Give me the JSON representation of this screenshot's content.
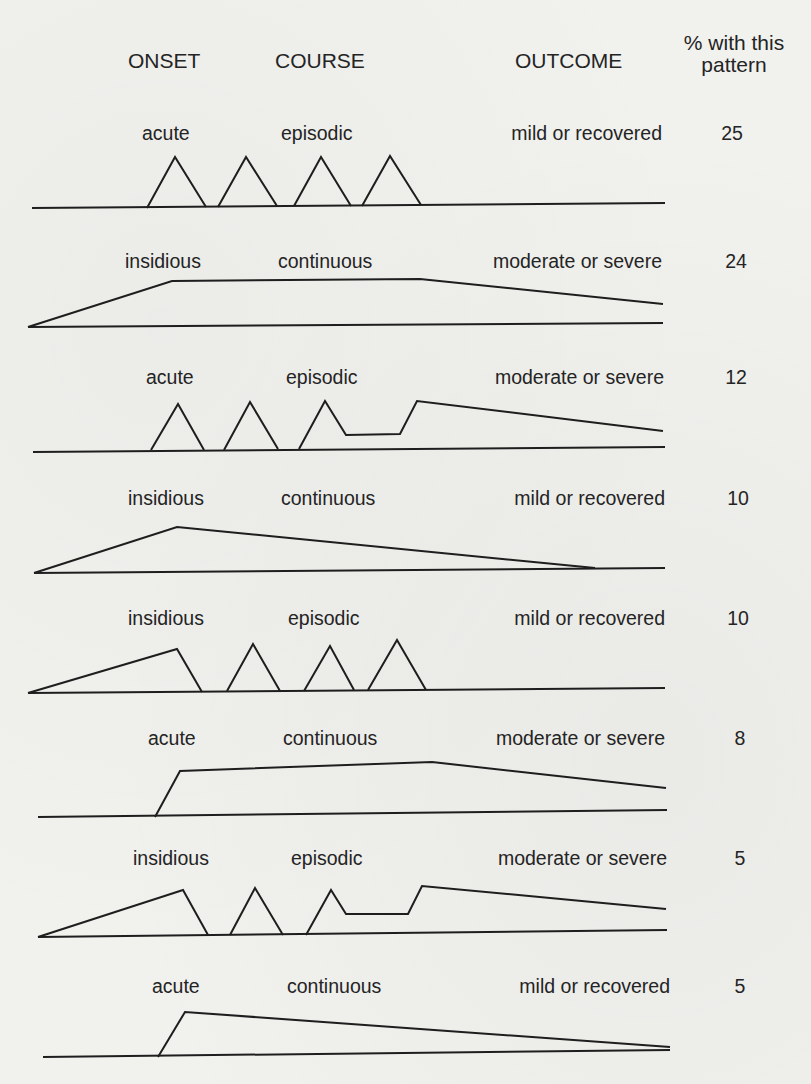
{
  "headers": {
    "onset": "ONSET",
    "course": "COURSE",
    "outcome": "OUTCOME",
    "percent_line1": "% with this",
    "percent_line2": "pattern"
  },
  "patterns": [
    {
      "onset": "acute",
      "course": "episodic",
      "outcome": "mild or recovered",
      "percent": "25",
      "label_y": 140,
      "onset_x": 142,
      "course_x": 281,
      "outcome_right": 662,
      "percent_x": 732,
      "baseline": [
        [
          32,
          208
        ],
        [
          665,
          203
        ]
      ],
      "curves": [
        [
          [
            147,
            208
          ],
          [
            175,
            157
          ],
          [
            206,
            207
          ]
        ],
        [
          [
            218,
            207
          ],
          [
            246,
            157
          ],
          [
            277,
            206
          ]
        ],
        [
          [
            294,
            206
          ],
          [
            321,
            157
          ],
          [
            351,
            206
          ]
        ],
        [
          [
            362,
            206
          ],
          [
            390,
            156
          ],
          [
            421,
            205
          ]
        ]
      ]
    },
    {
      "onset": "insidious",
      "course": "continuous",
      "outcome": "moderate or severe",
      "percent": "24",
      "label_y": 268,
      "onset_x": 125,
      "course_x": 278,
      "outcome_right": 662,
      "percent_x": 736,
      "baseline": [
        [
          28,
          327
        ],
        [
          663,
          323
        ]
      ],
      "curves": [
        [
          [
            28,
            327
          ],
          [
            172,
            281
          ],
          [
            420,
            279
          ],
          [
            663,
            304
          ]
        ]
      ]
    },
    {
      "onset": "acute",
      "course": "episodic",
      "outcome": "moderate or severe",
      "percent": "12",
      "label_y": 384,
      "onset_x": 146,
      "course_x": 286,
      "outcome_right": 664,
      "percent_x": 736,
      "baseline": [
        [
          33,
          452
        ],
        [
          665,
          447
        ]
      ],
      "curves": [
        [
          [
            151,
            450
          ],
          [
            178,
            404
          ],
          [
            204,
            450
          ]
        ],
        [
          [
            224,
            450
          ],
          [
            250,
            402
          ],
          [
            278,
            449
          ]
        ],
        [
          [
            299,
            449
          ],
          [
            325,
            401
          ],
          [
            346,
            435
          ],
          [
            400,
            434
          ],
          [
            417,
            401
          ],
          [
            663,
            431
          ]
        ]
      ]
    },
    {
      "onset": "insidious",
      "course": "continuous",
      "outcome": "mild or recovered",
      "percent": "10",
      "label_y": 505,
      "onset_x": 128,
      "course_x": 281,
      "outcome_right": 665,
      "percent_x": 738,
      "baseline": [
        [
          34,
          573
        ],
        [
          665,
          568
        ]
      ],
      "curves": [
        [
          [
            34,
            573
          ],
          [
            177,
            527
          ],
          [
            595,
            568
          ]
        ]
      ]
    },
    {
      "onset": "insidious",
      "course": "episodic",
      "outcome": "mild or recovered",
      "percent": "10",
      "label_y": 625,
      "onset_x": 128,
      "course_x": 288,
      "outcome_right": 665,
      "percent_x": 738,
      "baseline": [
        [
          28,
          693
        ],
        [
          665,
          688
        ]
      ],
      "curves": [
        [
          [
            28,
            693
          ],
          [
            177,
            649
          ],
          [
            202,
            692
          ]
        ],
        [
          [
            227,
            691
          ],
          [
            253,
            644
          ],
          [
            280,
            691
          ]
        ],
        [
          [
            304,
            691
          ],
          [
            330,
            646
          ],
          [
            354,
            690
          ]
        ],
        [
          [
            368,
            690
          ],
          [
            397,
            640
          ],
          [
            426,
            690
          ]
        ]
      ]
    },
    {
      "onset": "acute",
      "course": "continuous",
      "outcome": "moderate or severe",
      "percent": "8",
      "label_y": 745,
      "onset_x": 148,
      "course_x": 283,
      "outcome_right": 665,
      "percent_x": 740,
      "baseline": [
        [
          38,
          817
        ],
        [
          667,
          810
        ]
      ],
      "curves": [
        [
          [
            155,
            817
          ],
          [
            180,
            771
          ],
          [
            432,
            762
          ],
          [
            666,
            788
          ]
        ]
      ]
    },
    {
      "onset": "insidious",
      "course": "episodic",
      "outcome": "moderate or severe",
      "percent": "5",
      "label_y": 865,
      "onset_x": 133,
      "course_x": 291,
      "outcome_right": 667,
      "percent_x": 740,
      "baseline": [
        [
          38,
          937
        ],
        [
          667,
          930
        ]
      ],
      "curves": [
        [
          [
            38,
            937
          ],
          [
            183,
            890
          ],
          [
            208,
            935
          ]
        ],
        [
          [
            230,
            935
          ],
          [
            255,
            888
          ],
          [
            283,
            935
          ]
        ],
        [
          [
            306,
            935
          ],
          [
            331,
            890
          ],
          [
            346,
            914
          ],
          [
            408,
            914
          ],
          [
            422,
            886
          ],
          [
            666,
            909
          ]
        ]
      ]
    },
    {
      "onset": "acute",
      "course": "continuous",
      "outcome": "mild or recovered",
      "percent": "5",
      "label_y": 993,
      "onset_x": 152,
      "course_x": 287,
      "outcome_right": 670,
      "percent_x": 740,
      "baseline": [
        [
          43,
          1057
        ],
        [
          670,
          1050
        ]
      ],
      "curves": [
        [
          [
            158,
            1057
          ],
          [
            185,
            1012
          ],
          [
            670,
            1047
          ]
        ]
      ]
    }
  ]
}
